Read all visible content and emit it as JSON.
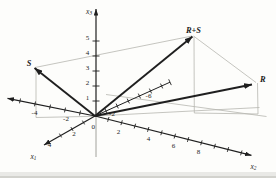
{
  "colors": {
    "line": "#1f1f1f",
    "construction": "#b6b6b0",
    "background": "#fdfdfb",
    "label": "#1c1c1c",
    "page_edge": "#d9d9d4"
  },
  "origin": {
    "label": "0"
  },
  "axes": {
    "x1": {
      "letter": "x",
      "sub": "1",
      "pos_ticks": [
        "2",
        "4"
      ],
      "neg_ticks": [
        "-2",
        "-6"
      ]
    },
    "x2": {
      "letter": "x",
      "sub": "2",
      "pos_ticks": [
        "2",
        "4",
        "6",
        "8"
      ],
      "neg_ticks": [
        "-4",
        "-2"
      ]
    },
    "x3": {
      "letter": "x",
      "sub": "3",
      "ticks": [
        "1",
        "2",
        "3",
        "4",
        "5"
      ]
    }
  },
  "vectors": {
    "s": "S",
    "r": "R",
    "r_plus_s": "R+S"
  }
}
